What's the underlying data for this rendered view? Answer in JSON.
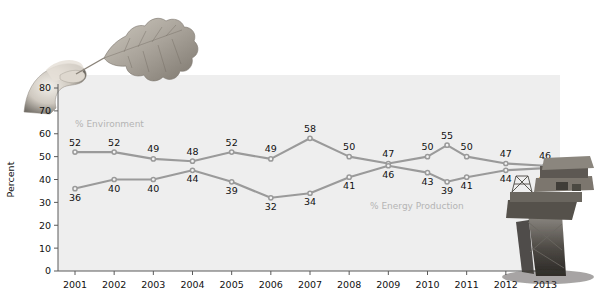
{
  "chart_data": {
    "type": "line",
    "title": "",
    "xlabel": "",
    "ylabel": "Percent",
    "ylim": [
      0,
      80
    ],
    "ytick_step": 10,
    "yticks": [
      "0",
      "10",
      "20",
      "30",
      "40",
      "50",
      "60",
      "70",
      "80"
    ],
    "categories": [
      "2001",
      "2002",
      "2003",
      "2004",
      "2005",
      "2006",
      "2007",
      "2008",
      "2009",
      "2010",
      "2010b",
      "2011",
      "2012",
      "2013"
    ],
    "xtick_labels": [
      "2001",
      "2002",
      "2003",
      "2004",
      "2005",
      "2006",
      "2007",
      "2008",
      "2009",
      "2010",
      "2011",
      "2012",
      "2013"
    ],
    "grid": false,
    "legend_position": "inline",
    "series": [
      {
        "name": "% Environment",
        "color": "#9a9a9a",
        "values": [
          52,
          52,
          49,
          48,
          52,
          49,
          58,
          50,
          47,
          50,
          55,
          50,
          47,
          46
        ],
        "labels": [
          "52",
          "52",
          "49",
          "48",
          "52",
          "49",
          "58",
          "50",
          "47",
          "50",
          "55",
          "50",
          "47",
          "46"
        ],
        "label_positions": [
          "above",
          "above",
          "above",
          "above",
          "above",
          "above",
          "above",
          "above",
          "above",
          "above",
          "above",
          "above",
          "above",
          "above"
        ]
      },
      {
        "name": "% Energy Production",
        "color": "#9a9a9a",
        "values": [
          36,
          40,
          40,
          44,
          39,
          32,
          34,
          41,
          46,
          43,
          39,
          41,
          44,
          45
        ],
        "labels": [
          "36",
          "40",
          "40",
          "44",
          "39",
          "32",
          "34",
          "41",
          "46",
          "43",
          "39",
          "41",
          "44",
          "45"
        ],
        "label_positions": [
          "below",
          "below",
          "below",
          "below",
          "below",
          "below",
          "below",
          "below",
          "below",
          "below",
          "below",
          "below",
          "below",
          "below"
        ]
      }
    ],
    "annotations": [
      {
        "text": "% Environment",
        "x": 75,
        "y": 127
      },
      {
        "text": "% Energy Production",
        "x": 370,
        "y": 209
      }
    ]
  },
  "images": {
    "leaf_photo": "hand-holding-oak-leaf-photo",
    "rig_photo": "offshore-oil-rig-photo"
  },
  "colors": {
    "line": "#9a9a9a",
    "panel": "#eeeeee",
    "axis": "#5a5a5a",
    "series_label": "#b4b4b4"
  }
}
